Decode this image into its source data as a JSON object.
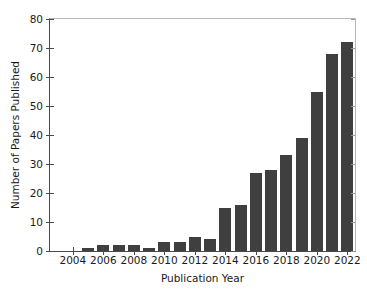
{
  "chart_data": {
    "type": "bar",
    "title": "",
    "xlabel": "Publication Year",
    "ylabel": "Number of Papers Published",
    "categories": [
      "2003",
      "2004",
      "2005",
      "2006",
      "2007",
      "2008",
      "2009",
      "2010",
      "2011",
      "2012",
      "2013",
      "2014",
      "2015",
      "2016",
      "2017",
      "2018",
      "2019",
      "2020",
      "2021",
      "2022"
    ],
    "values": [
      0,
      0,
      1,
      2,
      2,
      2,
      1,
      3,
      3,
      5,
      4,
      15,
      16,
      27,
      28,
      33,
      39,
      55,
      68,
      72
    ],
    "xlim": [
      2002.5,
      2022.5
    ],
    "ylim": [
      0,
      80
    ],
    "ytick_values": [
      0,
      10,
      20,
      30,
      40,
      50,
      60,
      70,
      80
    ],
    "ytick_labels": [
      "0",
      "10",
      "20",
      "30",
      "40",
      "50",
      "60",
      "70",
      "80"
    ],
    "xtick_values": [
      2004,
      2006,
      2008,
      2010,
      2012,
      2014,
      2016,
      2018,
      2020,
      2022
    ],
    "xtick_labels": [
      "2004",
      "2006",
      "2008",
      "2010",
      "2012",
      "2014",
      "2016",
      "2018",
      "2020",
      "2022"
    ],
    "grid": false,
    "legend": null,
    "bar_color": "#3f3f3f",
    "axis_color": "#4a4a4a",
    "background_color": "#ffffff"
  }
}
